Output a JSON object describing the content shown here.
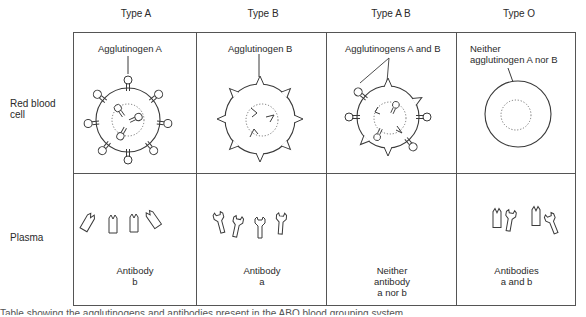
{
  "columns": [
    {
      "label": "Type A"
    },
    {
      "label": "Type B"
    },
    {
      "label": "Type A B"
    },
    {
      "label": "Type O"
    }
  ],
  "rows": [
    {
      "label": "Red blood\ncell"
    },
    {
      "label": "Plasma"
    }
  ],
  "red_blood_cell": {
    "type_a": "Agglutinogen A",
    "type_b": "Agglutinogen B",
    "type_ab": "Agglutinogens A and B",
    "type_o": "Neither\nagglutinogen A nor B"
  },
  "plasma": {
    "type_a": "Antibody\nb",
    "type_b": "Antibody\na",
    "type_ab": "Neither\nantibody\na nor b",
    "type_o": "Antibodies\na and b"
  },
  "caption": "Table showing the agglutinogens and antibodies present in the ABO blood grouping system",
  "colors": {
    "line": "#3a3a3a",
    "grid": "#555555",
    "background": "#ffffff"
  }
}
